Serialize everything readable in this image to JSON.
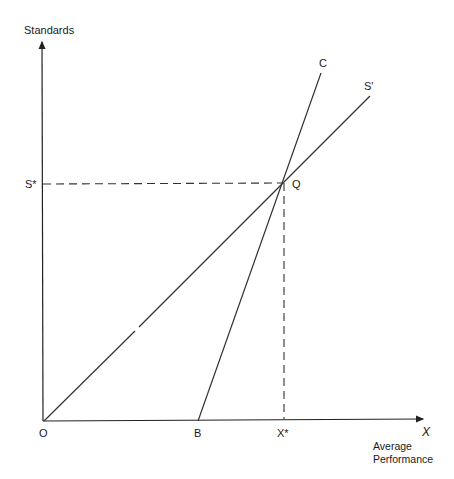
{
  "diagram": {
    "y_axis_label": "Standards",
    "x_axis_symbol": "X",
    "x_axis_label_line1": "Average",
    "x_axis_label_line2": "Performance",
    "origin_label": "O",
    "point_b_label": "B",
    "x_star_label": "X*",
    "s_star_label": "S*",
    "q_label": "Q",
    "line_c_label": "C",
    "line_s_prime_label": "S′",
    "line_color": "#222222"
  },
  "geometry": {
    "origin": [
      44,
      421
    ],
    "y_axis_top": [
      42,
      40
    ],
    "x_axis_end": [
      425,
      419
    ],
    "Q": [
      283,
      183
    ],
    "B": [
      198,
      421
    ],
    "C_end": [
      321,
      73
    ],
    "S_prime_end": [
      370,
      96
    ]
  }
}
